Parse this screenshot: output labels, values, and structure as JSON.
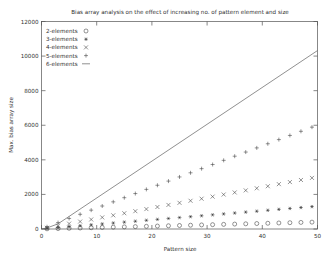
{
  "chart_data": {
    "type": "scatter",
    "title": "Bias array analysis on the effect of increasing no. of pattern element and size",
    "xlabel": "Pattern size",
    "ylabel": "Max. bias array size",
    "xlim": [
      0,
      50
    ],
    "ylim": [
      0,
      12000
    ],
    "xticks": [
      0,
      10,
      20,
      30,
      40,
      50
    ],
    "yticks": [
      0,
      2000,
      4000,
      6000,
      8000,
      10000,
      12000
    ],
    "xtick_labels": [
      "0",
      "10",
      "20",
      "30",
      "40",
      "50"
    ],
    "ytick_labels": [
      "0",
      "2000",
      "4000",
      "6000",
      "8000",
      "10000",
      "12000"
    ],
    "grid": false,
    "legend_position": "top-left",
    "x": [
      1,
      3,
      5,
      7,
      9,
      11,
      13,
      15,
      17,
      19,
      21,
      23,
      25,
      27,
      29,
      31,
      33,
      35,
      37,
      39,
      41,
      43,
      45,
      47,
      49
    ],
    "series": [
      {
        "name": "2-elements",
        "marker": "circle",
        "values": [
          10,
          25,
          42,
          58,
          74,
          90,
          106,
          122,
          138,
          155,
          171,
          187,
          203,
          219,
          235,
          251,
          268,
          284,
          300,
          316,
          332,
          348,
          364,
          381,
          397
        ]
      },
      {
        "name": "3-elements",
        "marker": "asterisk",
        "values": [
          30,
          82,
          135,
          188,
          240,
          293,
          346,
          398,
          451,
          504,
          556,
          609,
          662,
          714,
          767,
          820,
          872,
          925,
          978,
          1030,
          1083,
          1136,
          1188,
          1241,
          1294
        ]
      },
      {
        "name": "4-elements",
        "marker": "cross",
        "values": [
          70,
          190,
          310,
          430,
          551,
          671,
          791,
          911,
          1031,
          1152,
          1272,
          1392,
          1512,
          1632,
          1753,
          1873,
          1993,
          2113,
          2233,
          2354,
          2474,
          2594,
          2714,
          2834,
          2955
        ]
      },
      {
        "name": "5-elements",
        "marker": "plus",
        "values": [
          130,
          370,
          610,
          850,
          1090,
          1330,
          1570,
          1810,
          2050,
          2290,
          2530,
          2770,
          3010,
          3250,
          3490,
          3730,
          3970,
          4210,
          4450,
          4690,
          4930,
          5170,
          5410,
          5650,
          5890
        ]
      },
      {
        "name": "6-elements",
        "marker": "line",
        "line_x": [
          0,
          1,
          3,
          50
        ],
        "line_values": [
          0,
          60,
          300,
          10320
        ]
      }
    ],
    "legend_entries": [
      {
        "label": "2-elements",
        "marker": "circle"
      },
      {
        "label": "3-elements",
        "marker": "asterisk"
      },
      {
        "label": "4-elements",
        "marker": "cross"
      },
      {
        "label": "5-elements",
        "marker": "plus"
      },
      {
        "label": "6-elements",
        "marker": "line"
      }
    ]
  }
}
